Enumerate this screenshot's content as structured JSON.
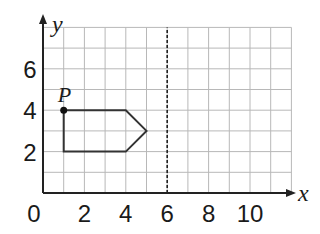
{
  "diagram": {
    "type": "coordinate-grid",
    "x_axis": {
      "label": "x",
      "ticks": [
        "0",
        "2",
        "4",
        "6",
        "8",
        "10"
      ],
      "range": [
        0,
        12
      ]
    },
    "y_axis": {
      "label": "y",
      "ticks": [
        "2",
        "4",
        "6"
      ],
      "range": [
        0,
        8
      ]
    },
    "grid": {
      "step": 1,
      "color": "#b0b0b0"
    },
    "shape": {
      "name": "pentagon",
      "vertices": [
        [
          1,
          4
        ],
        [
          4,
          4
        ],
        [
          5,
          3
        ],
        [
          4,
          2
        ],
        [
          1,
          2
        ]
      ],
      "color": "#333333"
    },
    "point": {
      "label": "P",
      "x": 1,
      "y": 4
    },
    "mirror_line": {
      "equation": "x = 6",
      "x": 6,
      "style": "dashed"
    }
  }
}
